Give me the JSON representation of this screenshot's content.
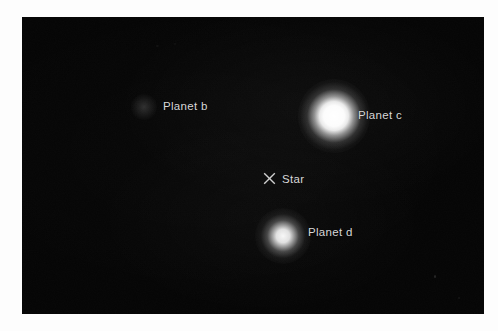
{
  "figure": {
    "kind": "direct-imaging-astronomical-photograph",
    "background_color": "#ffffff",
    "sky_color": "#050505",
    "label_color": "#d8d8d8"
  },
  "sky": {
    "star": {
      "label": "Star",
      "marker_icon": "cross-marker-icon",
      "marker_glyph": "×",
      "x": 248,
      "y": 162
    },
    "planets": [
      {
        "id": "planet-b",
        "label": "Planet b",
        "brightness": "very faint",
        "x": 122,
        "y": 90
      },
      {
        "id": "planet-c",
        "label": "Planet c",
        "brightness": "brightest",
        "x": 312,
        "y": 99
      },
      {
        "id": "planet-d",
        "label": "Planet d",
        "brightness": "moderate",
        "x": 261,
        "y": 219
      }
    ]
  }
}
